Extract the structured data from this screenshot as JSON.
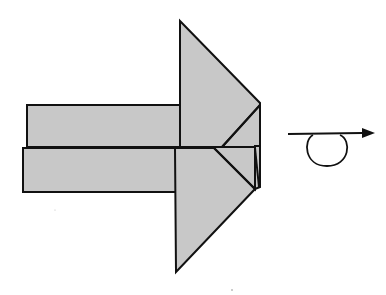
{
  "diagram": {
    "type": "origami-step",
    "colors": {
      "paper": "#c8c8c8",
      "stroke": "#111111",
      "background": "#ffffff"
    },
    "parts": {
      "upper_rectangle": {
        "x": 27,
        "y": 105,
        "width": 153,
        "height": 42
      },
      "lower_rectangle": {
        "x": 23,
        "y": 148,
        "width": 152,
        "height": 44
      },
      "top_triangle": {
        "points": "180,21 260,103 260,147 180,147"
      },
      "bottom_triangle": {
        "points": "175,148 255,148 255,189 176,272"
      }
    },
    "symbols": [
      {
        "name": "turn-over-loop-arrow",
        "meaning": "turn the model over",
        "direction": "right"
      }
    ]
  }
}
